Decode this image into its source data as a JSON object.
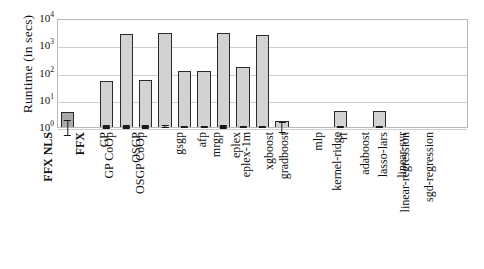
{
  "chart_data": {
    "type": "bar",
    "title": "",
    "xlabel": "",
    "ylabel": "Runtime (in secs)",
    "yscale": "log",
    "ylim": [
      1,
      10000
    ],
    "ytick_labels": [
      "10",
      "10",
      "10",
      "10",
      "10"
    ],
    "ytick_exponents": [
      "4",
      "3",
      "2",
      "1",
      "0"
    ],
    "ytick_values": [
      10000,
      1000,
      100,
      10,
      1
    ],
    "grid": "horizontal",
    "legend": "none",
    "categories": [
      "FFX NLS",
      "FFX",
      "GP",
      "GP CoOp",
      "OSGP",
      "OSGP CoOp",
      "gsgp",
      "afp",
      "mrgp",
      "eplex",
      "eplex-1m",
      "xgboost",
      "gradboost",
      "mlp",
      "rf",
      "kernel-ridge",
      "adaboost",
      "lasso-lars",
      "linear-svr",
      "linear-regression",
      "sgd-regression"
    ],
    "bold_categories": [
      "FFX NLS",
      "FFX"
    ],
    "values": [
      3.5,
      1.05,
      50,
      2500,
      55,
      2800,
      110,
      115,
      2900,
      155,
      2400,
      1.65,
      0.85,
      1.0,
      3.8,
      0.0,
      4.0,
      0.0,
      0.0,
      0.0,
      0.0
    ],
    "err_low": [
      1.6,
      0.95,
      44,
      2200,
      48,
      2500,
      100,
      105,
      2550,
      140,
      2200,
      1.0,
      0.78,
      0.9,
      3.4,
      0.0,
      3.7,
      0.0,
      0.0,
      0.0,
      0.0
    ],
    "err_high": [
      6.5,
      1.2,
      57,
      2900,
      63,
      3300,
      122,
      127,
      3300,
      172,
      2700,
      2.6,
      0.95,
      1.12,
      4.2,
      0.0,
      4.4,
      0.0,
      0.0,
      0.0,
      0.0
    ],
    "highlight_index": 0,
    "bar_face_color": "#d2d2d2",
    "bar_highlight_color": "#a8a8a8",
    "bar_edge_color": "#2a2a2a",
    "grid_color": "#cfcfcf",
    "frame_color": "#b9b9b9"
  }
}
